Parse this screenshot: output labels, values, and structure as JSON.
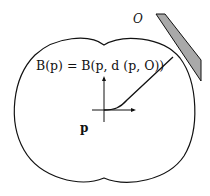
{
  "diagram": {
    "equation": "B(p) = B(p, d (p, O))",
    "point_label": "p",
    "obstacle_label": "O",
    "colors": {
      "stroke": "#111111",
      "obstacle_fill": "#a9a9a9",
      "background": "#ffffff"
    }
  }
}
